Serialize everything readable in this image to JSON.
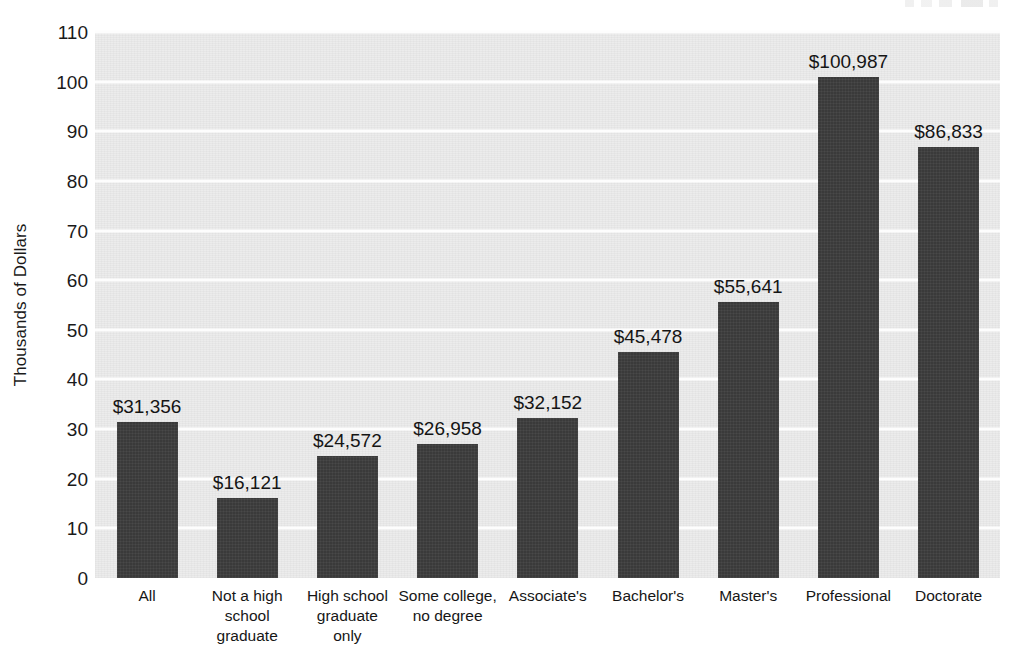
{
  "chart_data": {
    "type": "bar",
    "title": "",
    "subtitle": "",
    "xlabel": "",
    "ylabel": "Thousands of Dollars",
    "ylim": [
      0,
      110
    ],
    "y_ticks": [
      0,
      10,
      20,
      30,
      40,
      50,
      60,
      70,
      80,
      90,
      100,
      110
    ],
    "grid": true,
    "legend": null,
    "categories": [
      "All",
      "Not a high school graduate",
      "High school graduate only",
      "Some college, no degree",
      "Associate's",
      "Bachelor's",
      "Master's",
      "Professional",
      "Doctorate"
    ],
    "category_lines": [
      [
        "All"
      ],
      [
        "Not a high",
        "school",
        "graduate"
      ],
      [
        "High school",
        "graduate",
        "only"
      ],
      [
        "Some college,",
        "no degree"
      ],
      [
        "Associate's"
      ],
      [
        "Bachelor's"
      ],
      [
        "Master's"
      ],
      [
        "Professional"
      ],
      [
        "Doctorate"
      ]
    ],
    "values": [
      31.356,
      16.121,
      24.572,
      26.958,
      32.152,
      45.478,
      55.641,
      100.987,
      86.833
    ],
    "data_labels": [
      "$31,356",
      "$16,121",
      "$24,572",
      "$26,958",
      "$32,152",
      "$45,478",
      "$55,641",
      "$100,987",
      "$86,833"
    ],
    "colors": {
      "bar": "#3a3a3a",
      "plot_background": "#ececec",
      "gridline": "#fdfdfd",
      "text": "#1a1a1a",
      "page_background": "#ffffff"
    }
  }
}
